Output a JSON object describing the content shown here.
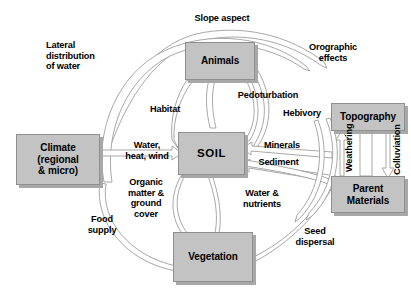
{
  "diagram": {
    "colors": {
      "box_fill": "#c3c3c3",
      "box_border": "#8f8f8f",
      "box_shadow": "#a8a8a8",
      "arrow_fill": "#ffffff",
      "arrow_stroke": "#9a9a9a",
      "text": "#000000",
      "background": "#ffffff"
    },
    "nodes": [
      {
        "id": "animals",
        "label": "Animals",
        "x": 185,
        "y": 42,
        "w": 70,
        "h": 38
      },
      {
        "id": "climate",
        "label": "Climate\n(regional\n& micro)",
        "x": 16,
        "y": 134,
        "w": 84,
        "h": 51
      },
      {
        "id": "soil",
        "label": "SOIL",
        "x": 178,
        "y": 132,
        "w": 67,
        "h": 43
      },
      {
        "id": "topography",
        "label": "Topography",
        "x": 331,
        "y": 103,
        "w": 74,
        "h": 28
      },
      {
        "id": "parent",
        "label": "Parent\nMaterials",
        "x": 331,
        "y": 176,
        "w": 74,
        "h": 37
      },
      {
        "id": "vegetation",
        "label": "Vegetation",
        "x": 173,
        "y": 232,
        "w": 80,
        "h": 50
      }
    ],
    "edge_labels": [
      {
        "id": "slope-aspect",
        "text": "Slope aspect",
        "x": 182,
        "y": 13,
        "w": 80,
        "align": "center"
      },
      {
        "id": "lateral-distribution",
        "text": "Lateral\ndistribution\nof water",
        "x": 46,
        "y": 40,
        "w": 74,
        "align": "left"
      },
      {
        "id": "orographic-effects",
        "text": "Orographic\neffects",
        "x": 297,
        "y": 42,
        "w": 72,
        "align": "center"
      },
      {
        "id": "habitat",
        "text": "Habitat",
        "x": 141,
        "y": 104,
        "w": 48,
        "align": "center"
      },
      {
        "id": "pedoturbation",
        "text": "Pedoturbation",
        "x": 228,
        "y": 90,
        "w": 80,
        "align": "center"
      },
      {
        "id": "hebivory",
        "text": "Hebivory",
        "x": 275,
        "y": 108,
        "w": 54,
        "align": "center"
      },
      {
        "id": "water-heat-wind",
        "text": "Water,\nheat, wind",
        "x": 116,
        "y": 140,
        "w": 62,
        "align": "center"
      },
      {
        "id": "minerals",
        "text": "Minerals",
        "x": 256,
        "y": 140,
        "w": 52,
        "align": "center"
      },
      {
        "id": "sediment",
        "text": "Sediment",
        "x": 251,
        "y": 157,
        "w": 55,
        "align": "center"
      },
      {
        "id": "organic-matter",
        "text": "Organic\nmatter &\nground\ncover",
        "x": 118,
        "y": 177,
        "w": 56,
        "align": "center"
      },
      {
        "id": "water-nutrients",
        "text": "Water &\nnutrients",
        "x": 234,
        "y": 188,
        "w": 56,
        "align": "center"
      },
      {
        "id": "food-supply",
        "text": "Food\nsupply",
        "x": 80,
        "y": 214,
        "w": 44,
        "align": "center"
      },
      {
        "id": "seed-dispersal",
        "text": "Seed\ndispersal",
        "x": 286,
        "y": 226,
        "w": 58,
        "align": "center"
      }
    ],
    "vertical_labels": [
      {
        "id": "weathering",
        "text": "Weathering",
        "x": 344,
        "y": 172
      },
      {
        "id": "colluviation",
        "text": "Colluviation",
        "x": 392,
        "y": 175
      }
    ]
  }
}
